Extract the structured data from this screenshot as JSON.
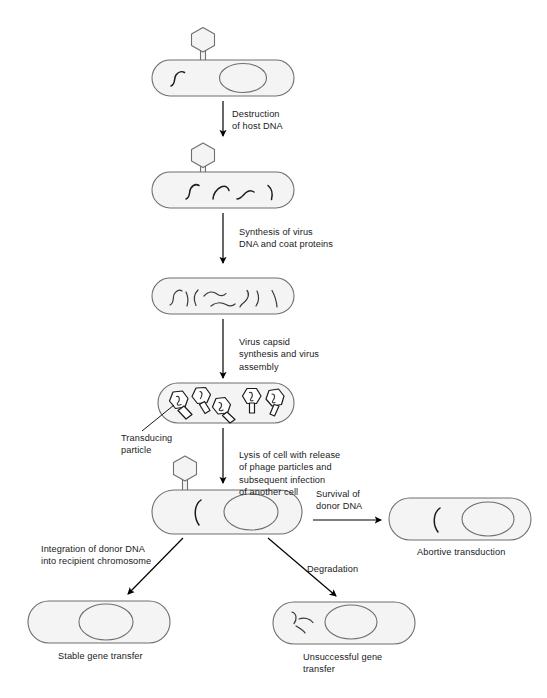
{
  "figure": {
    "background_color": "#ffffff",
    "cell_fill": "#f4f4f4",
    "cell_stroke": "#6f6f6f",
    "dna_stroke": "#1c1c1c",
    "text_color": "#1a1a1a"
  },
  "steps": [
    {
      "id": "step-1",
      "caption": "Destruction\nof host DNA",
      "cell_label": "host cell with phage attached, intact host chromosome and donor DNA"
    },
    {
      "id": "step-2",
      "caption": "Synthesis of virus\nDNA and coat proteins",
      "cell_label": "host cell with fragmented host DNA"
    },
    {
      "id": "step-3",
      "caption": "Virus capsid\nsynthesis and virus\nassembly",
      "cell_label": "host cell filled with viral DNA fragments"
    },
    {
      "id": "step-4",
      "caption": "Lysis of cell with release\nof phage particles and\nsubsequent infection\nof another cell",
      "cell_label": "host cell filled with assembled phage particles"
    }
  ],
  "annotations": {
    "transducing_particle": "Transducing\nparticle",
    "survival_of_donor_dna": "Survival of\ndonor DNA",
    "integration": "Integration of donor DNA\ninto recipient chromosome",
    "degradation": "Degradation"
  },
  "outcomes": [
    {
      "id": "abortive-transduction",
      "label": "Abortive transduction",
      "cell_label": "recipient cell with free donor DNA fragment and chromosome"
    },
    {
      "id": "stable-gene-transfer",
      "label": "Stable gene transfer",
      "cell_label": "recipient cell with donor DNA integrated into chromosome"
    },
    {
      "id": "unsuccessful-gene-transfer",
      "label": "Unsuccessful gene\ntransfer",
      "cell_label": "recipient cell with degraded donor DNA fragments"
    }
  ]
}
